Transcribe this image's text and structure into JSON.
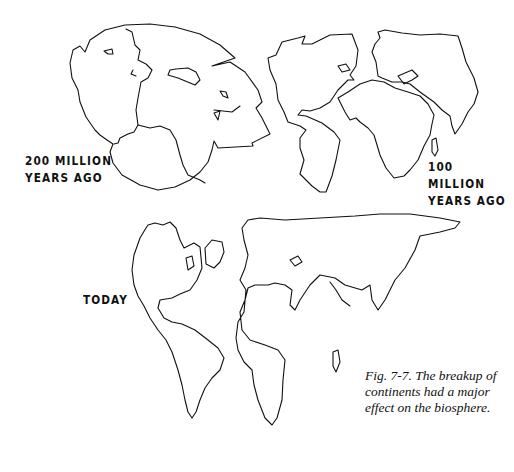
{
  "figure": {
    "panels": [
      {
        "id": "panel-200mya",
        "label_line1": "200 MILLION",
        "label_line2": "YEARS AGO"
      },
      {
        "id": "panel-100mya",
        "label_line1": "100 MILLION",
        "label_line2": "YEARS AGO"
      },
      {
        "id": "panel-today",
        "label_line1": "TODAY"
      }
    ],
    "caption": "Fig. 7-7.  The breakup of continents had a major effect on the biosphere."
  }
}
